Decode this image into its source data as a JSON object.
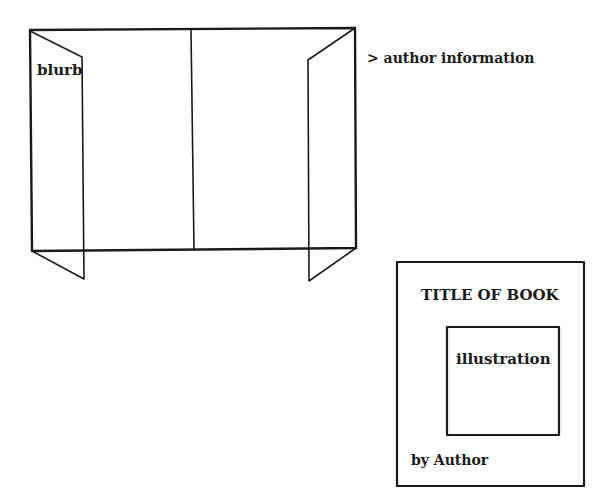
{
  "jacket": {
    "blurb_label": "blurb",
    "author_info_label": "> author information"
  },
  "cover": {
    "title": "TITLE OF BOOK",
    "illustration_label": "illustration",
    "author_label": "by Author"
  },
  "colors": {
    "stroke": "#1a1a1a",
    "background": "#ffffff"
  }
}
